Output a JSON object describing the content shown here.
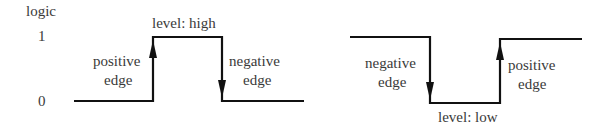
{
  "axis": {
    "ylabel": "logic",
    "tick_high": "1",
    "tick_low": "0"
  },
  "left_waveform": {
    "level_label": "level: high",
    "rise_label_1": "positive",
    "rise_label_2": "edge",
    "fall_label_1": "negative",
    "fall_label_2": "edge"
  },
  "right_waveform": {
    "level_label": "level: low",
    "fall_label_1": "negative",
    "fall_label_2": "edge",
    "rise_label_1": "positive",
    "rise_label_2": "edge"
  },
  "colors": {
    "line": "#111111",
    "text": "#3a3a3a"
  }
}
